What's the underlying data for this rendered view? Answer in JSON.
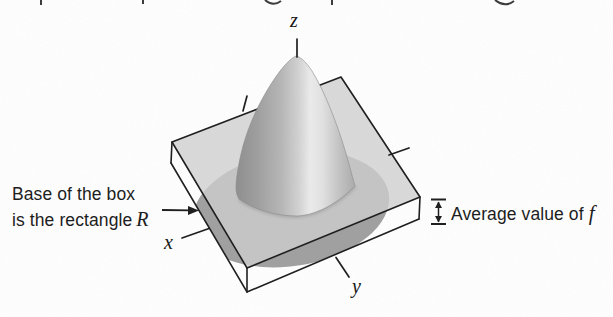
{
  "figure": {
    "type": "textbook-3d-diagram",
    "axis_labels": {
      "z": "z",
      "x": "x",
      "y": "y"
    },
    "left_caption": {
      "line1": "Base of the box",
      "line2": "is the rectangle",
      "math_symbol": "R"
    },
    "right_caption": {
      "text": "Average value of",
      "math_symbol": "f"
    },
    "colors": {
      "background": "#ffffff",
      "line": "#1c1c1c",
      "plane_fill": "#d9d9d9",
      "through_plane_shadow": "#c4c4c4",
      "cone_below_plane": "#a0a0a0",
      "cone_dark_side": "#919191",
      "cone_highlight": "#ebebeb",
      "text": "#1d1d1d"
    }
  }
}
